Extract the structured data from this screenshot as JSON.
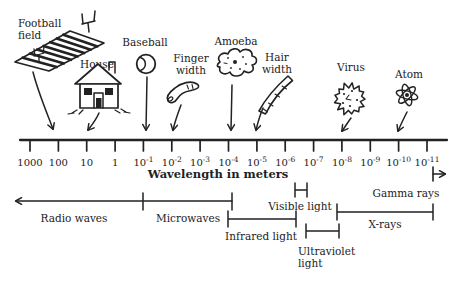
{
  "diagram_title": "Wavelength in meters",
  "colors": {
    "ink": "#222222",
    "background": "#ffffff"
  },
  "axis": {
    "label": "Wavelength in meters",
    "ticks": [
      {
        "text": "1000"
      },
      {
        "text": "100"
      },
      {
        "text": "10"
      },
      {
        "text": "1"
      },
      {
        "base": "10",
        "exp": "-1"
      },
      {
        "base": "10",
        "exp": "-2"
      },
      {
        "base": "10",
        "exp": "-3"
      },
      {
        "base": "10",
        "exp": "-4"
      },
      {
        "base": "10",
        "exp": "-5"
      },
      {
        "base": "10",
        "exp": "-6"
      },
      {
        "base": "10",
        "exp": "-7"
      },
      {
        "base": "10",
        "exp": "-8"
      },
      {
        "base": "10",
        "exp": "-9"
      },
      {
        "base": "10",
        "exp": "-10"
      },
      {
        "base": "10",
        "exp": "-11"
      }
    ]
  },
  "objects": [
    {
      "id": "football-field",
      "label_lines": [
        "Football",
        "field"
      ],
      "points_to_tick": "100"
    },
    {
      "id": "house",
      "label_lines": [
        "House"
      ],
      "points_to_tick": "10"
    },
    {
      "id": "baseball",
      "label_lines": [
        "Baseball"
      ],
      "points_to_tick": "10^-1"
    },
    {
      "id": "finger-width",
      "label_lines": [
        "Finger",
        "width"
      ],
      "points_to_tick": "10^-2"
    },
    {
      "id": "amoeba",
      "label_lines": [
        "Amoeba"
      ],
      "points_to_tick": "10^-4"
    },
    {
      "id": "hair-width",
      "label_lines": [
        "Hair",
        "width"
      ],
      "points_to_tick": "10^-5"
    },
    {
      "id": "virus",
      "label_lines": [
        "Virus"
      ],
      "points_to_tick": "10^-8"
    },
    {
      "id": "atom",
      "label_lines": [
        "Atom"
      ],
      "points_to_tick": "10^-10"
    }
  ],
  "bands": [
    {
      "id": "radio-waves",
      "label": "Radio waves"
    },
    {
      "id": "microwaves",
      "label": "Microwaves"
    },
    {
      "id": "infrared",
      "label": "Infrared light"
    },
    {
      "id": "visible",
      "label": "Visible light"
    },
    {
      "id": "ultraviolet",
      "label_lines": [
        "Ultraviolet",
        "light"
      ]
    },
    {
      "id": "x-rays",
      "label": "X-rays"
    },
    {
      "id": "gamma-rays",
      "label": "Gamma rays"
    }
  ]
}
